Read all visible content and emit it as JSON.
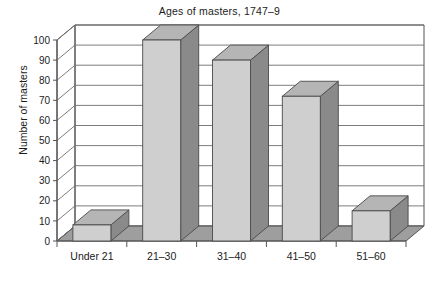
{
  "chart_data": {
    "type": "bar",
    "title": "Ages of masters, 1747–9",
    "xlabel": "",
    "ylabel": "Number of masters",
    "categories": [
      "Under 21",
      "21–30",
      "31–40",
      "41–50",
      "51–60"
    ],
    "values": [
      8,
      100,
      90,
      72,
      15
    ],
    "ylim": [
      0,
      100
    ],
    "yticks": [
      0,
      10,
      20,
      30,
      40,
      50,
      60,
      70,
      80,
      90,
      100
    ],
    "ytick_labels": [
      "0",
      "10",
      "20",
      "30",
      "40",
      "50",
      "60",
      "70",
      "80",
      "90",
      "100"
    ],
    "grid": true,
    "legend": false,
    "style": "3d-bar",
    "colors": {
      "bar_front": "#cfcfcf",
      "bar_side": "#8a8a8a",
      "bar_top": "#b5b5b5",
      "floor": "#9e9e9e",
      "wall": "#ffffff",
      "axis": "#555555",
      "grid_line": "#6e6e6e",
      "text": "#1b1b1b"
    }
  }
}
